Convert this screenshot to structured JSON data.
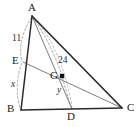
{
  "figure": {
    "type": "geometry-diagram",
    "width": 140,
    "height": 127,
    "background_color": "#ffffff",
    "stroke_colors": {
      "triangle_outline": "#262626",
      "cevian": "#7a7a7a",
      "measure_arc": "#8c8c8c"
    },
    "points": [
      {
        "id": "A",
        "label": "A",
        "x": 32,
        "y": 16,
        "label_x": 28,
        "label_y": 3
      },
      {
        "id": "B",
        "label": "B",
        "x": 21,
        "y": 110,
        "label_x": 9,
        "label_y": 108
      },
      {
        "id": "C",
        "label": "C",
        "x": 122,
        "y": 108,
        "label_x": 127,
        "label_y": 105
      },
      {
        "id": "D",
        "label": "D",
        "x": 72,
        "y": 109,
        "label_x": 68,
        "label_y": 113
      },
      {
        "id": "E",
        "label": "E",
        "x": 23,
        "y": 62,
        "label_x": 13,
        "label_y": 56
      },
      {
        "id": "G",
        "label": "G",
        "x": 62,
        "y": 76,
        "label_x": 51,
        "label_y": 71
      }
    ],
    "segments": [
      {
        "id": "AB",
        "from": "A",
        "to": "B",
        "style": "solid-thick"
      },
      {
        "id": "AC",
        "from": "A",
        "to": "C",
        "style": "solid-thick"
      },
      {
        "id": "BC",
        "from": "B",
        "to": "C",
        "style": "solid-thick"
      },
      {
        "id": "AD",
        "from": "A",
        "to": "D",
        "style": "solid-thin"
      },
      {
        "id": "EC",
        "from": "E",
        "to": "C",
        "style": "solid-thin"
      }
    ],
    "measures": [
      {
        "id": "AE",
        "label": "11",
        "segment": "A to E",
        "label_x": 13,
        "label_y": 35
      },
      {
        "id": "EB",
        "label": "x",
        "segment": "E to B",
        "label_x": 11,
        "label_y": 81,
        "italic": true
      },
      {
        "id": "AG",
        "label": "24",
        "segment": "A to G",
        "label_x": 58,
        "label_y": 57
      },
      {
        "id": "GD",
        "label": "y",
        "segment": "G to D",
        "label_x": 57,
        "label_y": 87,
        "italic": true
      }
    ],
    "marked_point": {
      "id": "G",
      "shape": "filled-square"
    }
  }
}
